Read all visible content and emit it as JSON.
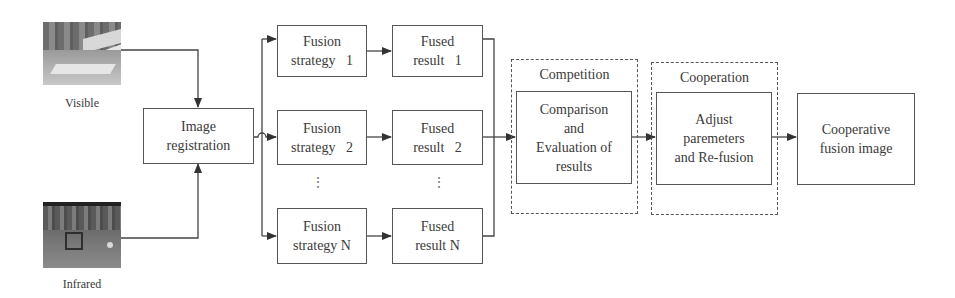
{
  "inputs": {
    "visible": {
      "label": "Visible"
    },
    "infrared": {
      "label": "Infrared"
    }
  },
  "registration": {
    "line1": "Image",
    "line2": "registration"
  },
  "strategies": [
    {
      "line1": "Fusion",
      "line2": "strategy   1"
    },
    {
      "line1": "Fusion",
      "line2": "strategy   2"
    },
    {
      "line1": "Fusion",
      "line2": "strategy N"
    }
  ],
  "results": [
    {
      "line1": "Fused",
      "line2": "result   1"
    },
    {
      "line1": "Fused",
      "line2": "result   2"
    },
    {
      "line1": "Fused",
      "line2": "result N"
    }
  ],
  "ellipsis": "⋮",
  "competition": {
    "title": "Competition",
    "box": {
      "line1": "Comparison",
      "line2": "and",
      "line3": "Evaluation of",
      "line4": "results"
    }
  },
  "cooperation": {
    "title": "Cooperation",
    "box": {
      "line1": "Adjust",
      "line2": "paremeters",
      "line3": "and Re-fusion"
    }
  },
  "output": {
    "line1": "Cooperative",
    "line2": "fusion image"
  },
  "colors": {
    "line": "#444444",
    "text": "#3a3a3a",
    "background": "#ffffff"
  }
}
